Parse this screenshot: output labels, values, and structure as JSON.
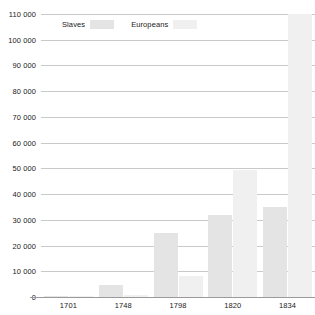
{
  "chart_data": {
    "type": "bar",
    "title": "",
    "subtitle": "",
    "xlabel": "",
    "ylabel": "",
    "categories": [
      "1701",
      "1748",
      "1798",
      "1820",
      "1834"
    ],
    "series": [
      {
        "name": "Slaves",
        "color": "#e4e4e4",
        "values": [
          500,
          4500,
          25000,
          32000,
          35000
        ]
      },
      {
        "name": "Europeans",
        "color": "#f0f0f0",
        "values": [
          300,
          800,
          8000,
          49500,
          110000
        ]
      }
    ],
    "ylim": [
      0,
      110000
    ],
    "ytick_values": [
      0,
      10000,
      20000,
      30000,
      40000,
      50000,
      60000,
      70000,
      80000,
      90000,
      100000,
      110000
    ],
    "ytick_labels": [
      "0",
      "10 000",
      "20 000",
      "30 000",
      "40 000",
      "50 000",
      "60 000",
      "70 000",
      "80 000",
      "90 000",
      "100 000",
      "110 000"
    ],
    "grid": true,
    "legend_position": "top-left",
    "legend": [
      {
        "label": "Slaves",
        "color": "#e4e4e4"
      },
      {
        "label": "Europeans",
        "color": "#f0f0f0"
      }
    ]
  },
  "colors": {
    "background": "#ffffff",
    "gridline": "#c9c9c9",
    "axis": "#9a9a9a",
    "text": "#1a1a1a",
    "slaves_bar": "#e4e4e4",
    "europeans_bar": "#f0f0f0"
  }
}
